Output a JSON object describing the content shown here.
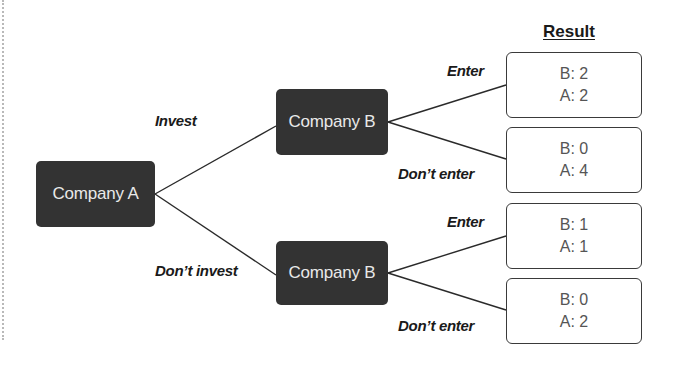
{
  "header": {
    "result_label": "Result"
  },
  "nodes": {
    "root": "Company A",
    "top_child": "Company B",
    "bottom_child": "Company B"
  },
  "branches": {
    "invest": "Invest",
    "dont_invest": "Don’t invest",
    "top_enter": "Enter",
    "top_dont_enter": "Don’t enter",
    "bottom_enter": "Enter",
    "bottom_dont_enter": "Don’t enter"
  },
  "results": [
    {
      "b": "B: 2",
      "a": "A: 2"
    },
    {
      "b": "B: 0",
      "a": "A: 4"
    },
    {
      "b": "B: 1",
      "a": "A: 1"
    },
    {
      "b": "B: 0",
      "a": "A: 2"
    }
  ],
  "colors": {
    "node_fill": "#333333",
    "node_text": "#e9e9e9",
    "result_border": "#3a3a3a",
    "result_text": "#555555",
    "label_text": "#1a1a1a"
  }
}
